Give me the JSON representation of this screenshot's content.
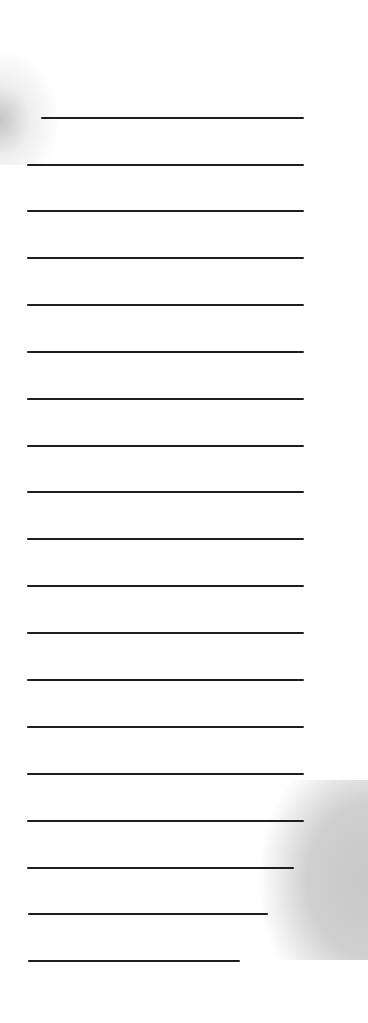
{
  "image": {
    "subject": "sheet of ruled notebook paper",
    "background_color": "#ffffff",
    "line_color": "#1e1e1e",
    "shadow_color": "#cccccc",
    "line_count": 19
  },
  "lines": [
    {
      "y": 118,
      "x1": 41,
      "x2": 304
    },
    {
      "y": 165,
      "x1": 27,
      "x2": 304
    },
    {
      "y": 211,
      "x1": 27,
      "x2": 304
    },
    {
      "y": 258,
      "x1": 27,
      "x2": 304
    },
    {
      "y": 305,
      "x1": 27,
      "x2": 304
    },
    {
      "y": 352,
      "x1": 27,
      "x2": 304
    },
    {
      "y": 399,
      "x1": 27,
      "x2": 304
    },
    {
      "y": 446,
      "x1": 27,
      "x2": 304
    },
    {
      "y": 492,
      "x1": 27,
      "x2": 304
    },
    {
      "y": 539,
      "x1": 27,
      "x2": 304
    },
    {
      "y": 586,
      "x1": 27,
      "x2": 304
    },
    {
      "y": 633,
      "x1": 27,
      "x2": 304
    },
    {
      "y": 680,
      "x1": 27,
      "x2": 304
    },
    {
      "y": 727,
      "x1": 27,
      "x2": 304
    },
    {
      "y": 774,
      "x1": 27,
      "x2": 304
    },
    {
      "y": 821,
      "x1": 27,
      "x2": 304
    },
    {
      "y": 868,
      "x1": 27,
      "x2": 294
    },
    {
      "y": 914,
      "x1": 28,
      "x2": 268
    },
    {
      "y": 961,
      "x1": 28,
      "x2": 240
    }
  ]
}
